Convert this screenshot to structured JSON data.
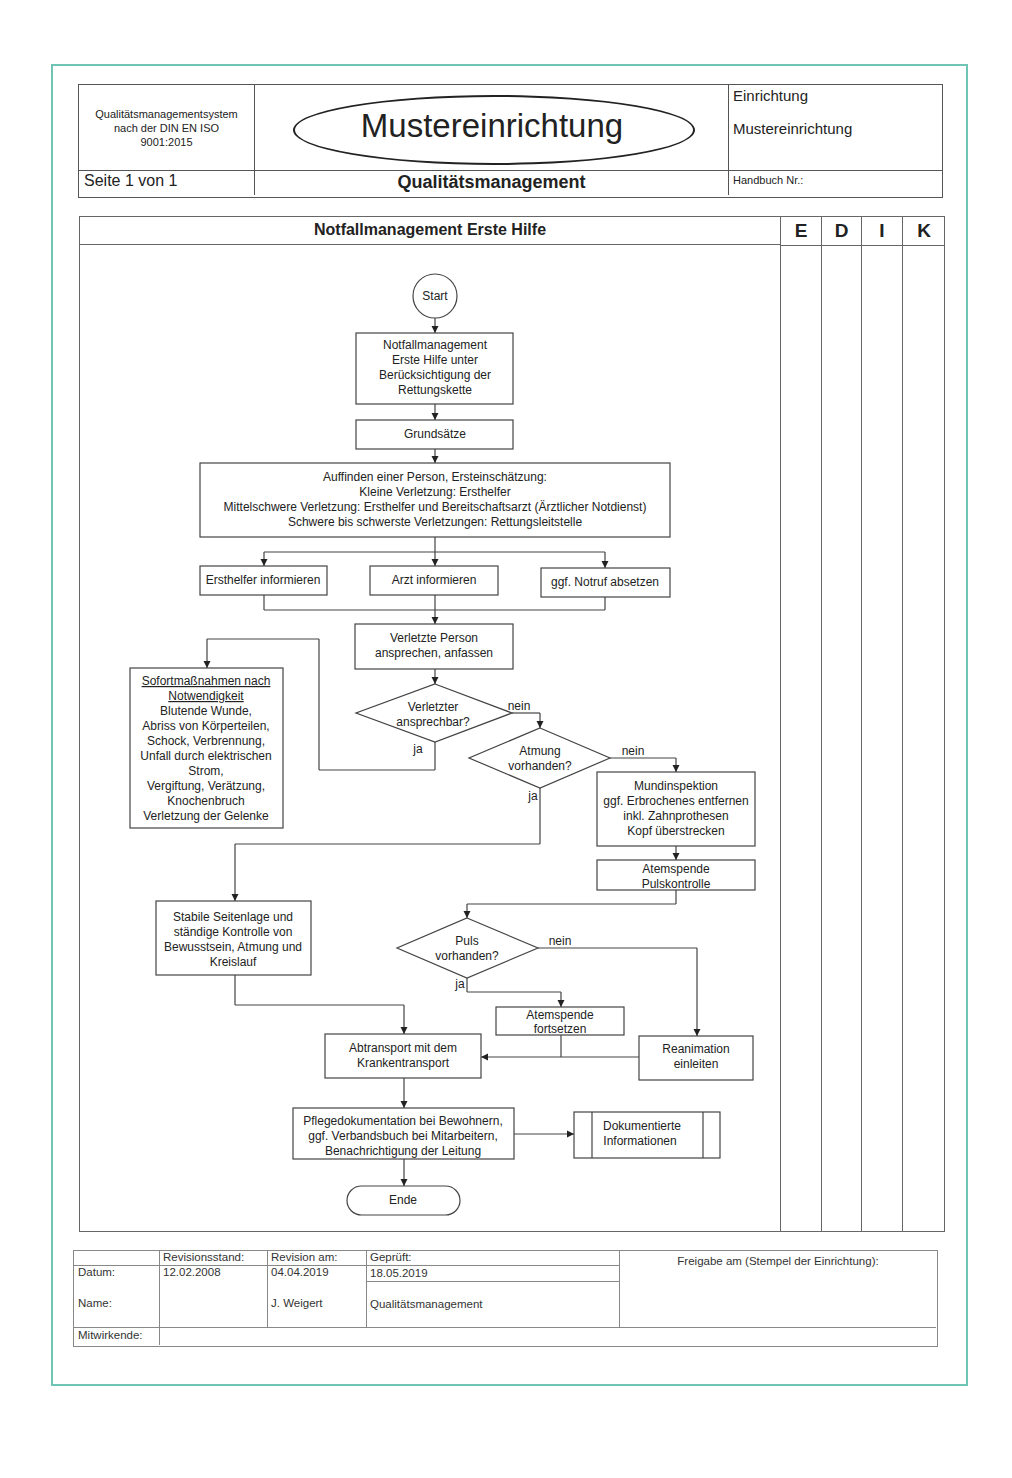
{
  "header": {
    "qms_label": [
      "Qualitätsmanagementsystem",
      "nach der DIN EN ISO",
      "9001:2015"
    ],
    "facility_logo_text": "Mustereinrichtung",
    "facility_label": "Einrichtung",
    "facility_name": "Mustereinrichtung",
    "page_label": "Seite 1 von 1",
    "section_title": "Qualitätsmanagement",
    "handbook_label": "Handbuch Nr.:"
  },
  "process": {
    "title": "Notfallmanagement Erste Hilfe",
    "columns": [
      "E",
      "D",
      "I",
      "K"
    ]
  },
  "flowchart": {
    "start": "Start",
    "step1": [
      "Notfallmanagement",
      "Erste Hilfe unter",
      "Berücksichtigung der",
      "Rettungskette"
    ],
    "step2": "Grundsätze",
    "step3": [
      "Auffinden einer Person, Ersteinschätzung:",
      "Kleine Verletzung: Ersthelfer",
      "Mittelschwere Verletzung: Ersthelfer und Bereitschaftsarzt (Ärztlicher Notdienst)",
      "Schwere bis schwerste Verletzungen: Rettungsleitstelle"
    ],
    "inform_helper": "Ersthelfer informieren",
    "inform_doctor": "Arzt informieren",
    "emergency_call": "ggf. Notruf absetzen",
    "address_person": [
      "Verletzte Person",
      "ansprechen, anfassen"
    ],
    "immediate_measures_title": [
      "Sofortmaßnahmen nach",
      "Notwendigkeit"
    ],
    "immediate_measures": [
      "Blutende Wunde,",
      "Abriss von Körperteilen,",
      "Schock, Verbrennung,",
      "Unfall durch elektrischen",
      "Strom,",
      "Vergiftung, Verätzung,",
      "Knochenbruch",
      "Verletzung der Gelenke"
    ],
    "decision_responsive": [
      "Verletzter",
      "ansprechbar?"
    ],
    "decision_breathing": [
      "Atmung",
      "vorhanden?"
    ],
    "mouth_inspection": [
      "Mundinspektion",
      "ggf. Erbrochenes entfernen",
      "inkl. Zahnprothesen",
      "Kopf überstrecken"
    ],
    "ventilation_pulse": [
      "Atemspende",
      "Pulskontrolle"
    ],
    "recovery_position": [
      "Stabile Seitenlage und",
      "ständige Kontrolle von",
      "Bewusstsein, Atmung und",
      "Kreislauf"
    ],
    "decision_pulse": [
      "Puls",
      "vorhanden?"
    ],
    "continue_ventilation": [
      "Atemspende",
      "fortsetzen"
    ],
    "resuscitation": [
      "Reanimation",
      "einleiten"
    ],
    "transport": [
      "Abtransport mit dem",
      "Krankentransport"
    ],
    "documentation": [
      "Pflegedokumentation bei Bewohnern,",
      "ggf. Verbandsbuch bei Mitarbeitern,",
      "Benachrichtigung der Leitung"
    ],
    "documented_info": [
      "Dokumentierte",
      "Informationen"
    ],
    "end": "Ende",
    "label_yes": "ja",
    "label_no": "nein"
  },
  "footer": {
    "headers": [
      "",
      "Revisionsstand:",
      "Revision am:",
      "Geprüft:"
    ],
    "row_date": [
      "Datum:",
      "12.02.2008",
      "04.04.2019",
      "18.05.2019"
    ],
    "row_name": [
      "Name:",
      "",
      "J. Weigert",
      "Qualitätsmanagement"
    ],
    "contributors_label": "Mitwirkende:",
    "release_label": "Freigabe am (Stempel der Einrichtung):"
  },
  "colors": {
    "frame": "#6fc4b4",
    "line": "#333333"
  }
}
